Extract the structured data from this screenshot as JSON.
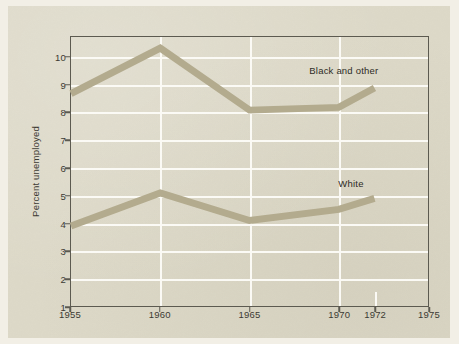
{
  "figure": {
    "background_color": "#f2efe6",
    "card_color": "#ddd9c8",
    "axis_color": "#5c5a50",
    "gridline_color": "#fbfaf5"
  },
  "chart_data": {
    "type": "line",
    "title": "",
    "xlabel": "",
    "ylabel": "Percent unemployed",
    "xlim": [
      1955,
      1975
    ],
    "ylim": [
      1,
      10.75
    ],
    "grid": true,
    "legend_position": "inline-right",
    "x_ticks": [
      1955,
      1960,
      1965,
      1970,
      1972,
      1975
    ],
    "x_tick_labels": [
      "1955",
      "1960",
      "1965",
      "1970",
      "1972",
      "1975"
    ],
    "y_ticks": [
      1,
      2,
      3,
      4,
      5,
      6,
      7,
      8,
      9,
      10
    ],
    "y_tick_labels": [
      "1",
      "2",
      "3",
      "4",
      "5",
      "6",
      "7",
      "8",
      "9",
      "10"
    ],
    "x": [
      1955,
      1960,
      1965,
      1970,
      1972
    ],
    "series": [
      {
        "name": "Black and other",
        "color": "#b3ab8e",
        "values": [
          8.7,
          10.35,
          8.1,
          8.2,
          8.9
        ],
        "label_x": 1970.2,
        "label_y": 9.55
      },
      {
        "name": "White",
        "color": "#b3ab8e",
        "values": [
          3.9,
          5.1,
          4.1,
          4.5,
          4.9
        ],
        "label_x": 1970.6,
        "label_y": 5.5
      }
    ]
  }
}
